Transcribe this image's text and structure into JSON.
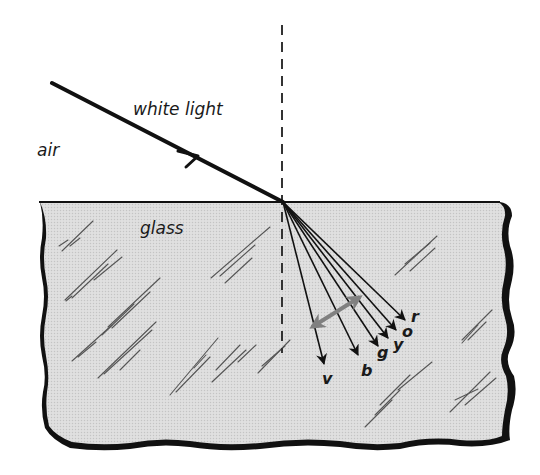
{
  "diagram": {
    "media": {
      "air": "air",
      "glass": "glass"
    },
    "incident_ray_label": "white light",
    "normal_style": "dashed",
    "refracted_rays": [
      {
        "id": "r",
        "label": "r",
        "color_name": "red"
      },
      {
        "id": "o",
        "label": "o",
        "color_name": "orange"
      },
      {
        "id": "y",
        "label": "y",
        "color_name": "yellow"
      },
      {
        "id": "g",
        "label": "g",
        "color_name": "green"
      },
      {
        "id": "b",
        "label": "b",
        "color_name": "blue"
      },
      {
        "id": "v",
        "label": "v",
        "color_name": "violet"
      }
    ],
    "spread_indicator": "double-headed gray arrow across refracted rays",
    "colors": {
      "ink": "#111111",
      "glass_fill": "#d9d9d9",
      "glass_edge": "#111111",
      "scratch": "#555555",
      "spread_arrow": "#808080",
      "background": "#ffffff"
    }
  }
}
